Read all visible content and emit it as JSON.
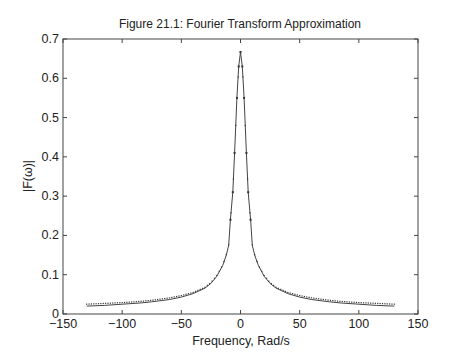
{
  "chart_data": {
    "type": "line",
    "title": "Figure 21.1: Fourier Transform Approximation",
    "xlabel": "Frequency, Rad/s",
    "ylabel": "|F(ω)|",
    "xlim": [
      -150,
      150
    ],
    "ylim": [
      0,
      0.7
    ],
    "xticks": [
      -150,
      -100,
      -50,
      0,
      50,
      100,
      150
    ],
    "xtick_labels": [
      "−150",
      "−100",
      "−50",
      "0",
      "50",
      "100",
      "150"
    ],
    "yticks": [
      0,
      0.1,
      0.2,
      0.3,
      0.4,
      0.5,
      0.6,
      0.7
    ],
    "ytick_labels": [
      "0",
      "0.1",
      "0.2",
      "0.3",
      "0.4",
      "0.5",
      "0.6",
      "0.7"
    ],
    "grid": false,
    "legend": null,
    "series": [
      {
        "name": "exact",
        "style": "solid",
        "x": [
          -130,
          -115,
          -100,
          -85,
          -75,
          -60,
          -50,
          -40,
          -30,
          -25,
          -20,
          -15,
          -12,
          -10,
          -8.5,
          -6.5,
          -5,
          -3,
          -1.5,
          0,
          1.5,
          3,
          5,
          6.5,
          8.5,
          10,
          12,
          15,
          20,
          25,
          30,
          40,
          50,
          60,
          75,
          85,
          100,
          115,
          130
        ],
        "y": [
          0.02,
          0.022,
          0.025,
          0.028,
          0.031,
          0.037,
          0.043,
          0.052,
          0.066,
          0.078,
          0.096,
          0.124,
          0.15,
          0.175,
          0.24,
          0.31,
          0.41,
          0.55,
          0.63,
          0.667,
          0.63,
          0.55,
          0.41,
          0.31,
          0.24,
          0.175,
          0.15,
          0.124,
          0.096,
          0.078,
          0.066,
          0.052,
          0.043,
          0.037,
          0.031,
          0.028,
          0.025,
          0.022,
          0.02
        ]
      },
      {
        "name": "approximation",
        "style": "dotted",
        "x": [
          -130,
          -115,
          -100,
          -85,
          -75,
          -60,
          -50,
          -40,
          -30,
          -25,
          -20,
          -15,
          -12,
          -10,
          -8.5,
          -6.5,
          -5,
          -3,
          -1.5,
          0,
          1.5,
          3,
          5,
          6.5,
          8.5,
          10,
          12,
          15,
          20,
          25,
          30,
          40,
          50,
          60,
          75,
          85,
          100,
          115,
          130
        ],
        "y": [
          0.025,
          0.027,
          0.029,
          0.032,
          0.035,
          0.041,
          0.047,
          0.055,
          0.068,
          0.08,
          0.098,
          0.125,
          0.151,
          0.176,
          0.24,
          0.31,
          0.41,
          0.55,
          0.63,
          0.667,
          0.63,
          0.55,
          0.41,
          0.31,
          0.24,
          0.176,
          0.151,
          0.125,
          0.098,
          0.08,
          0.068,
          0.055,
          0.047,
          0.041,
          0.035,
          0.032,
          0.029,
          0.027,
          0.025
        ]
      }
    ],
    "colors": {
      "line": "#444444",
      "axis": "#333333",
      "text": "#222222"
    }
  }
}
